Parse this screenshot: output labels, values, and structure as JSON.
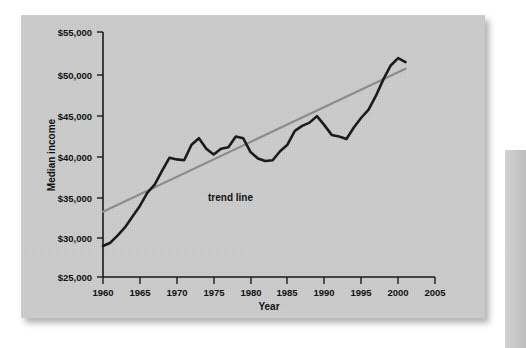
{
  "figure": {
    "background_color": "#cccccc",
    "page_background": "#ffffff",
    "annotation_label": "trend line"
  },
  "chart_data": {
    "type": "line",
    "title": "",
    "xlabel": "Year",
    "ylabel": "Median income",
    "xlim": [
      1960,
      2005
    ],
    "ylim": [
      25000,
      55000
    ],
    "grid": false,
    "legend": "none",
    "x_ticks": [
      1960,
      1965,
      1970,
      1975,
      1980,
      1985,
      1990,
      1995,
      2000,
      2005
    ],
    "x_tick_labels": [
      "1960",
      "1965",
      "1970",
      "1975",
      "1980",
      "1985",
      "1990",
      "1995",
      "2000",
      "2005"
    ],
    "y_ticks": [
      25000,
      30000,
      35000,
      40000,
      45000,
      50000,
      55000
    ],
    "y_tick_labels": [
      "$25,000",
      "$30,000",
      "$35,000",
      "$40,000",
      "$45,000",
      "$50,000",
      "$55,000"
    ],
    "series": [
      {
        "name": "Median income",
        "color": "#1b1b1b",
        "x": [
          1960,
          1961,
          1962,
          1963,
          1964,
          1965,
          1966,
          1967,
          1968,
          1969,
          1970,
          1971,
          1972,
          1973,
          1974,
          1975,
          1976,
          1977,
          1978,
          1979,
          1980,
          1981,
          1982,
          1983,
          1984,
          1985,
          1986,
          1987,
          1988,
          1989,
          1990,
          1991,
          1992,
          1993,
          1994,
          1995,
          1996,
          1997,
          1998,
          1999,
          2000,
          2001
        ],
        "values": [
          28800,
          29200,
          30100,
          31100,
          32400,
          33700,
          35300,
          36300,
          38000,
          39600,
          39400,
          39300,
          41200,
          42000,
          40700,
          40000,
          40700,
          40900,
          42200,
          42000,
          40300,
          39500,
          39200,
          39300,
          40400,
          41200,
          42900,
          43500,
          43900,
          44700,
          43600,
          42400,
          42200,
          41900,
          43300,
          44500,
          45500,
          47200,
          49200,
          50900,
          51800,
          51300
        ]
      },
      {
        "name": "trend line",
        "color": "#8c8c8c",
        "type": "linear_fit",
        "x": [
          1960,
          2001
        ],
        "values": [
          33000,
          50500
        ]
      }
    ],
    "annotations": [
      {
        "text": "trend line",
        "x": 1976.5,
        "y": 38000
      }
    ]
  },
  "axes": {
    "y_axis_label": "Median income",
    "x_axis_label": "Year"
  }
}
